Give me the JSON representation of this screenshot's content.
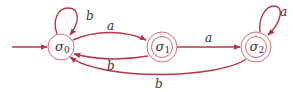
{
  "diagram": {
    "type": "finite-state-automaton",
    "colors": {
      "edge": "#b8364a",
      "node_stroke": "#c0485a",
      "text": "#333333"
    },
    "start_state": "σ0",
    "states": [
      {
        "id": "s0",
        "symbol": "σ",
        "index": "0",
        "accepting": false
      },
      {
        "id": "s1",
        "symbol": "σ",
        "index": "1",
        "accepting": true
      },
      {
        "id": "s2",
        "symbol": "σ",
        "index": "2",
        "accepting": true
      }
    ],
    "transitions": [
      {
        "from": "σ0",
        "to": "σ0",
        "label": "b"
      },
      {
        "from": "σ0",
        "to": "σ1",
        "label": "a"
      },
      {
        "from": "σ1",
        "to": "σ0",
        "label": "b"
      },
      {
        "from": "σ1",
        "to": "σ2",
        "label": "a"
      },
      {
        "from": "σ2",
        "to": "σ2",
        "label": "a"
      },
      {
        "from": "σ2",
        "to": "σ0",
        "label": "b"
      }
    ]
  }
}
